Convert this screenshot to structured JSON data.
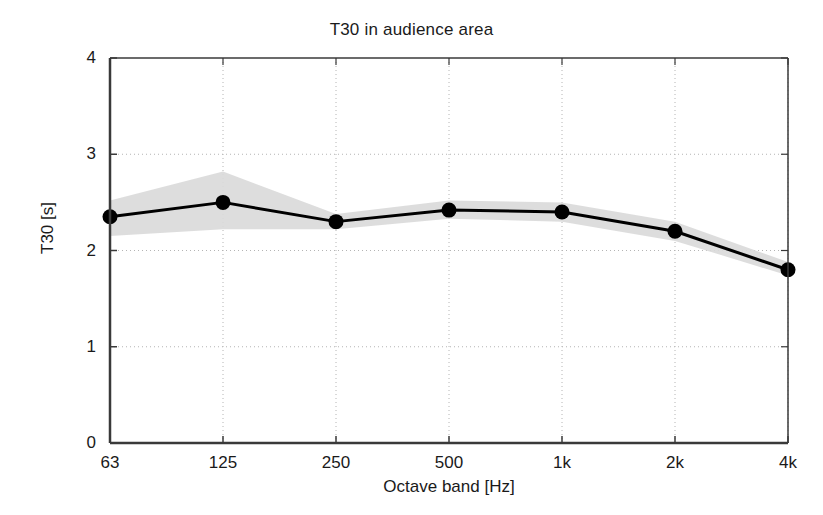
{
  "chart_data": {
    "type": "line",
    "title": "T30 in audience area",
    "xlabel": "Octave band [Hz]",
    "ylabel": "T30 [s]",
    "categories": [
      "63",
      "125",
      "250",
      "500",
      "1k",
      "2k",
      "4k"
    ],
    "xtick_labels": [
      "63",
      "125",
      "250",
      "500",
      "1k",
      "2k",
      "4k"
    ],
    "ytick_labels": [
      "0",
      "1",
      "2",
      "3",
      "4"
    ],
    "yticks": [
      0,
      1,
      2,
      3,
      4
    ],
    "ylim": [
      0,
      4
    ],
    "grid": "dotted",
    "legend": "none",
    "series": [
      {
        "name": "T30 mean",
        "values": [
          2.35,
          2.5,
          2.3,
          2.42,
          2.4,
          2.2,
          1.8
        ],
        "marker": "filled-circle",
        "color": "#000000",
        "linewidth": 3
      }
    ],
    "band": {
      "name": "standard deviation range",
      "upper": [
        2.52,
        2.82,
        2.38,
        2.52,
        2.5,
        2.3,
        1.88
      ],
      "lower": [
        2.15,
        2.22,
        2.22,
        2.33,
        2.3,
        2.1,
        1.74
      ],
      "color": "#d9d9d9"
    },
    "annotations": []
  },
  "axes": {
    "frame_color": "#3a3a3a",
    "grid_color": "#b4b4b4",
    "background": "#ffffff"
  }
}
